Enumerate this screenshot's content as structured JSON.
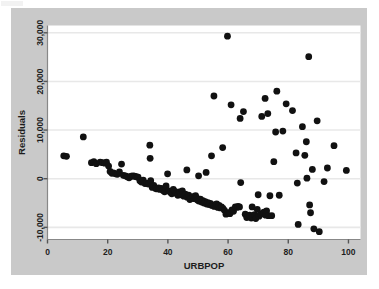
{
  "figure": {
    "background_color": "#c9c9c9",
    "plot_background_color": "#ffffff",
    "point_color": "#111111",
    "gridline_color": "#e8e8e8",
    "axis_color": "#888888"
  },
  "chart_data": {
    "type": "scatter",
    "title": "",
    "xlabel": "URBPOP",
    "ylabel": "Residuals",
    "xlim": [
      0,
      104
    ],
    "ylim": [
      -12500,
      31500
    ],
    "xticks": [
      0,
      20,
      40,
      60,
      80,
      100
    ],
    "xtick_labels": [
      "0",
      "20",
      "40",
      "60",
      "80",
      "100"
    ],
    "yticks": [
      -10000,
      0,
      10000,
      20000,
      30000
    ],
    "ytick_labels": [
      "-10,000",
      "0",
      "10,000",
      "20,000",
      "30,000"
    ],
    "grid": true,
    "grid_axis": "y",
    "legend": null,
    "marker": "circle",
    "marker_size": 3.4,
    "n_points": 151,
    "points": [
      [
        5.4,
        4700
      ],
      [
        6.3,
        4600
      ],
      [
        11.9,
        8600
      ],
      [
        14.6,
        3300
      ],
      [
        15.4,
        3500
      ],
      [
        16.2,
        3100
      ],
      [
        17.5,
        3400
      ],
      [
        18.3,
        3300
      ],
      [
        19.0,
        3200
      ],
      [
        19.6,
        3400
      ],
      [
        20.3,
        2600
      ],
      [
        20.8,
        1500
      ],
      [
        21.4,
        1100
      ],
      [
        21.9,
        1200
      ],
      [
        22.6,
        1000
      ],
      [
        23.2,
        900
      ],
      [
        23.9,
        1400
      ],
      [
        24.6,
        3000
      ],
      [
        25.2,
        700
      ],
      [
        25.9,
        600
      ],
      [
        26.5,
        400
      ],
      [
        27.1,
        200
      ],
      [
        27.8,
        500
      ],
      [
        28.4,
        600
      ],
      [
        28.9,
        500
      ],
      [
        29.5,
        400
      ],
      [
        30.1,
        300
      ],
      [
        30.7,
        -400
      ],
      [
        31.2,
        -700
      ],
      [
        31.8,
        -300
      ],
      [
        32.4,
        -1000
      ],
      [
        32.9,
        -900
      ],
      [
        33.5,
        -1100
      ],
      [
        34.0,
        6900
      ],
      [
        34.1,
        4200
      ],
      [
        34.3,
        -400
      ],
      [
        34.8,
        -1800
      ],
      [
        35.3,
        -1400
      ],
      [
        35.9,
        -2000
      ],
      [
        36.4,
        -2100
      ],
      [
        36.9,
        -1900
      ],
      [
        37.4,
        -2200
      ],
      [
        37.9,
        -2000
      ],
      [
        38.4,
        -2400
      ],
      [
        38.9,
        -2700
      ],
      [
        39.4,
        -1500
      ],
      [
        39.9,
        1000
      ],
      [
        40.3,
        -2500
      ],
      [
        40.8,
        -2800
      ],
      [
        41.3,
        -3100
      ],
      [
        41.8,
        -2200
      ],
      [
        42.3,
        -2600
      ],
      [
        42.8,
        -3000
      ],
      [
        43.3,
        -3400
      ],
      [
        43.8,
        -2700
      ],
      [
        44.3,
        -3300
      ],
      [
        44.8,
        -2500
      ],
      [
        45.3,
        -3600
      ],
      [
        45.8,
        -3200
      ],
      [
        46.3,
        1800
      ],
      [
        46.4,
        -3800
      ],
      [
        46.9,
        -3400
      ],
      [
        47.3,
        -4300
      ],
      [
        47.8,
        -4000
      ],
      [
        48.3,
        -3700
      ],
      [
        48.8,
        -4100
      ],
      [
        49.2,
        -3500
      ],
      [
        49.5,
        -3900
      ],
      [
        49.8,
        -4400
      ],
      [
        50.2,
        600
      ],
      [
        50.3,
        -4600
      ],
      [
        50.8,
        -4200
      ],
      [
        51.2,
        -4800
      ],
      [
        51.6,
        -4500
      ],
      [
        52.0,
        -5000
      ],
      [
        52.4,
        -4700
      ],
      [
        52.7,
        1300
      ],
      [
        52.9,
        -5200
      ],
      [
        53.3,
        -4900
      ],
      [
        53.7,
        -5300
      ],
      [
        54.1,
        -5100
      ],
      [
        54.5,
        4700
      ],
      [
        54.6,
        -5500
      ],
      [
        55.0,
        -5400
      ],
      [
        55.3,
        17000
      ],
      [
        55.4,
        -5700
      ],
      [
        55.8,
        -5600
      ],
      [
        56.2,
        -5200
      ],
      [
        56.6,
        -5900
      ],
      [
        57.0,
        -5500
      ],
      [
        57.4,
        -6000
      ],
      [
        57.8,
        -5800
      ],
      [
        58.2,
        6400
      ],
      [
        58.3,
        -6100
      ],
      [
        58.8,
        -6500
      ],
      [
        59.3,
        -7300
      ],
      [
        59.8,
        29300
      ],
      [
        60.1,
        -7000
      ],
      [
        60.6,
        -7200
      ],
      [
        61.0,
        15200
      ],
      [
        61.3,
        -6400
      ],
      [
        61.8,
        -6700
      ],
      [
        62.4,
        -5800
      ],
      [
        62.9,
        -5900
      ],
      [
        63.3,
        -5700
      ],
      [
        63.8,
        -5800
      ],
      [
        64.0,
        12400
      ],
      [
        64.2,
        -800
      ],
      [
        65.1,
        13800
      ],
      [
        65.7,
        -7300
      ],
      [
        66.2,
        -8000
      ],
      [
        66.7,
        -7800
      ],
      [
        67.2,
        -7500
      ],
      [
        67.7,
        -8100
      ],
      [
        68.0,
        -5800
      ],
      [
        68.3,
        -7900
      ],
      [
        68.8,
        -7400
      ],
      [
        69.2,
        -8200
      ],
      [
        69.7,
        -6300
      ],
      [
        70.0,
        -3300
      ],
      [
        70.3,
        -7700
      ],
      [
        70.8,
        -7300
      ],
      [
        71.2,
        12800
      ],
      [
        71.5,
        -7100
      ],
      [
        71.9,
        -6900
      ],
      [
        72.3,
        16500
      ],
      [
        72.5,
        -7500
      ],
      [
        72.8,
        -6600
      ],
      [
        73.2,
        13400
      ],
      [
        73.4,
        -7600
      ],
      [
        73.9,
        -3500
      ],
      [
        74.5,
        -7600
      ],
      [
        75.2,
        3500
      ],
      [
        75.8,
        9600
      ],
      [
        76.2,
        18000
      ],
      [
        77.0,
        -3400
      ],
      [
        78.2,
        9800
      ],
      [
        79.3,
        15400
      ],
      [
        81.4,
        14000
      ],
      [
        82.6,
        5300
      ],
      [
        83.0,
        -900
      ],
      [
        83.3,
        -9400
      ],
      [
        84.7,
        10700
      ],
      [
        85.5,
        4800
      ],
      [
        86.0,
        7600
      ],
      [
        86.2,
        100
      ],
      [
        86.8,
        25100
      ],
      [
        87.1,
        -5400
      ],
      [
        87.4,
        -7000
      ],
      [
        88.0,
        1900
      ],
      [
        88.5,
        -10300
      ],
      [
        89.6,
        11900
      ],
      [
        90.3,
        -10900
      ],
      [
        91.9,
        -600
      ],
      [
        93.0,
        2200
      ],
      [
        95.2,
        6800
      ],
      [
        99.3,
        1700
      ]
    ]
  }
}
